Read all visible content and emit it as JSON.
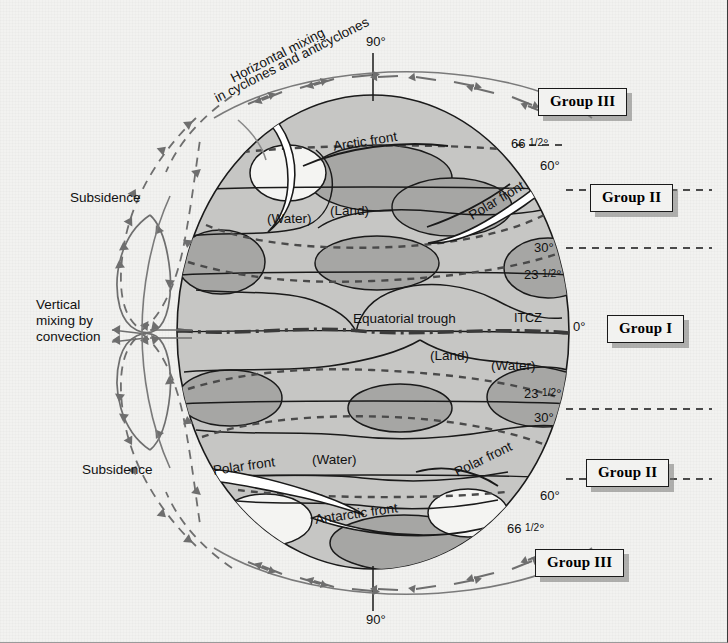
{
  "figure": {
    "background_color": "#f2f2f0",
    "ocean_fill": "#c9c9c7",
    "land_fill": "#a8a8a6",
    "globe_fill": "#c4c4c2",
    "line_color": "#1a1a1a",
    "arrow_color": "#6e6e6e",
    "front_fill": "#ffffff"
  },
  "latitudes": {
    "north_pole": "90°",
    "arctic_circle": "66 1/2°",
    "north_sixty": "60°",
    "north_thirty": "30°",
    "tropic_cancer": "23 1/2°",
    "equator": "0°",
    "tropic_capricorn": "23 1/2°",
    "south_thirty": "30°",
    "south_sixty": "60°",
    "antarctic_circle": "66 1/2°",
    "south_pole": "90°"
  },
  "groups": [
    {
      "id": "group-3-north",
      "label": "Group III"
    },
    {
      "id": "group-2-north",
      "label": "Group II"
    },
    {
      "id": "group-1-equator",
      "label": "Group I"
    },
    {
      "id": "group-2-south",
      "label": "Group II"
    },
    {
      "id": "group-3-south",
      "label": "Group III"
    }
  ],
  "annotations": {
    "horizontal_mixing_line1": "Horizontal mixing",
    "horizontal_mixing_line2": "in cyclones and anticyclones",
    "subsidence_north": "Subsidence",
    "subsidence_south": "Subsidence",
    "vertical_mixing_line1": "Vertical",
    "vertical_mixing_line2": "mixing by",
    "vertical_mixing_line3": "convection",
    "arctic_front": "Arctic front",
    "polar_front_north": "Polar front",
    "polar_front_south_left": "Polar front",
    "polar_front_south_right": "Polar front",
    "antarctic_front": "Antarctic front",
    "equatorial_trough": "Equatorial trough",
    "itcz": "ITCZ"
  },
  "surface_labels": {
    "water_north_upper": "(Water)",
    "land_north_upper": "(Land)",
    "land_south": "(Land)",
    "water_south_right": "(Water)",
    "water_south_lower": "(Water)"
  }
}
